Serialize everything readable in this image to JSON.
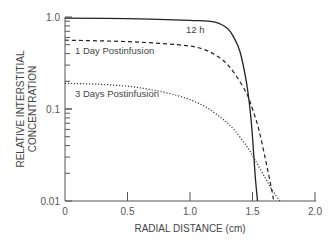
{
  "chart_data": {
    "type": "line",
    "title": "",
    "xlabel": "RADIAL DISTANCE (cm)",
    "ylabel": [
      "RELATIVE INTERSTITIAL",
      "CONCENTRATION"
    ],
    "xlim": [
      0,
      2.0
    ],
    "ylim": [
      0.01,
      1.0
    ],
    "yscale": "log",
    "grid": false,
    "legend": "inline annotations",
    "x_ticks": [
      "0",
      "0.5",
      "1.0",
      "1.5",
      "2.0"
    ],
    "y_ticks": [
      "0.01",
      "0.1",
      "1.0"
    ],
    "series": [
      {
        "name": "12 h",
        "style": "solid",
        "x": [
          0,
          0.5,
          1.0,
          1.2,
          1.3,
          1.35,
          1.4,
          1.45,
          1.48,
          1.5,
          1.52,
          1.54
        ],
        "y": [
          0.97,
          0.96,
          0.92,
          0.88,
          0.75,
          0.6,
          0.42,
          0.2,
          0.1,
          0.05,
          0.02,
          0.01
        ]
      },
      {
        "name": "1 Day Postinfusion",
        "style": "dashed",
        "x": [
          0,
          0.5,
          0.9,
          1.1,
          1.25,
          1.35,
          1.45,
          1.5,
          1.55,
          1.6,
          1.65,
          1.67
        ],
        "y": [
          0.56,
          0.54,
          0.5,
          0.45,
          0.35,
          0.25,
          0.15,
          0.1,
          0.06,
          0.03,
          0.014,
          0.01
        ]
      },
      {
        "name": "3 Days Postinfusion",
        "style": "dotted",
        "x": [
          0,
          0.3,
          0.6,
          0.9,
          1.1,
          1.25,
          1.35,
          1.45,
          1.52,
          1.6,
          1.66,
          1.72
        ],
        "y": [
          0.19,
          0.185,
          0.17,
          0.14,
          0.11,
          0.08,
          0.06,
          0.04,
          0.028,
          0.018,
          0.013,
          0.01
        ]
      }
    ],
    "annotations": [
      {
        "text": "12 h",
        "x": 1.05,
        "y": 0.78
      },
      {
        "text": "1 Day Postinfusion",
        "x": 0.1,
        "y": 0.42
      },
      {
        "text": "3 Days Postinfusion",
        "x": 0.1,
        "y": 0.13
      }
    ]
  },
  "labels": {
    "x_axis_title": "RADIAL DISTANCE (cm)",
    "y_axis_title_line1": "RELATIVE INTERSTITIAL",
    "y_axis_title_line2": "CONCENTRATION",
    "x_tick_0": "0",
    "x_tick_1": "0.5",
    "x_tick_2": "1.0",
    "x_tick_3": "1.5",
    "x_tick_4": "2.0",
    "y_tick_0": "0.01",
    "y_tick_1": "0.1",
    "y_tick_2": "1.0",
    "annot_12h": "12 h",
    "annot_1day": "1 Day Postinfusion",
    "annot_3days": "3 Days Postinfusion"
  }
}
